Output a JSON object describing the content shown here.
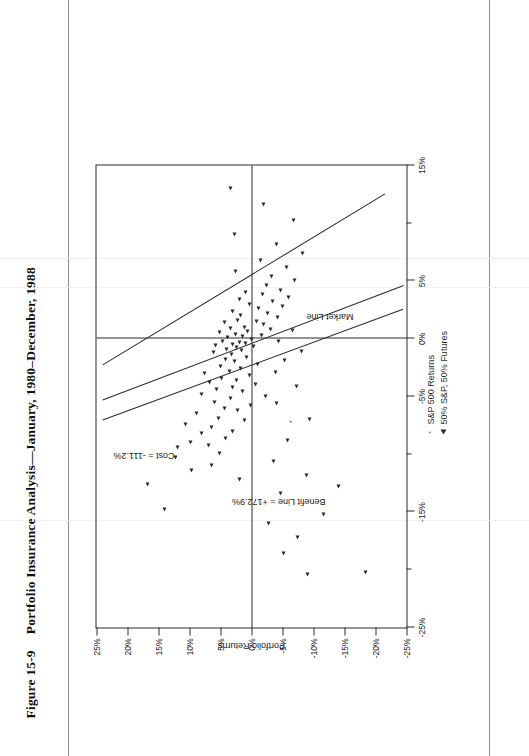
{
  "caption": {
    "figure_number": "Figure 15-9",
    "title": "Portfolio Insurance Analysis—January, 1980–December, 1988"
  },
  "chart_data": {
    "type": "scatter",
    "title": "Portfolio Insurance Analysis—January, 1980–December, 1988",
    "xlabel": "",
    "ylabel": "Portfolio Returns",
    "xlim": [
      -25,
      15
    ],
    "ylim": [
      -25,
      25
    ],
    "grid": false,
    "x_ticks": [
      -25,
      -20,
      -15,
      -10,
      -5,
      0,
      5,
      10,
      15
    ],
    "x_tick_labels": [
      "-25%",
      "",
      "-15%",
      "",
      "-5%",
      "0%",
      "5%",
      "",
      "15%"
    ],
    "y_ticks": [
      25,
      20,
      15,
      10,
      5,
      0,
      -5,
      -10,
      -15,
      -20,
      -25
    ],
    "y_tick_labels": [
      "25%",
      "20%",
      "15%",
      "10%",
      "5%",
      "0%",
      "-5%",
      "-10%",
      "-15%",
      "-20%",
      "-25%"
    ],
    "legend_position": "below-right",
    "series": [
      {
        "name": "S&P 500 Returns",
        "marker": "dot",
        "points": [
          [
            -7.2,
            -6.3
          ]
        ]
      },
      {
        "name": "50% S&P, 50% Futures",
        "marker": "triangle",
        "points": [
          [
            -20.4,
            -9.1
          ],
          [
            -14.8,
            14.0
          ],
          [
            -12.6,
            16.8
          ],
          [
            -12.2,
            2.0
          ],
          [
            -11.4,
            9.6
          ],
          [
            -11.0,
            6.4
          ],
          [
            -10.3,
            12.2
          ],
          [
            -9.9,
            5.2
          ],
          [
            -9.4,
            12.0
          ],
          [
            -9.2,
            7.0
          ],
          [
            -9.0,
            9.8
          ],
          [
            -8.6,
            4.2
          ],
          [
            -8.2,
            8.1
          ],
          [
            -8.0,
            3.0
          ],
          [
            -7.7,
            6.4
          ],
          [
            -7.4,
            10.6
          ],
          [
            -7.1,
            1.2
          ],
          [
            -6.9,
            5.4
          ],
          [
            -6.5,
            8.8
          ],
          [
            -6.2,
            2.2
          ],
          [
            -6.0,
            4.4
          ],
          [
            -5.8,
            0.2
          ],
          [
            -5.5,
            6.0
          ],
          [
            -5.2,
            3.4
          ],
          [
            -5.0,
            -2.2
          ],
          [
            -4.8,
            8.0
          ],
          [
            -4.6,
            1.4
          ],
          [
            -4.4,
            5.6
          ],
          [
            -4.2,
            3.0
          ],
          [
            -4.0,
            -0.6
          ],
          [
            -3.8,
            6.8
          ],
          [
            -3.6,
            2.4
          ],
          [
            -3.4,
            4.8
          ],
          [
            -3.2,
            0.4
          ],
          [
            -3.0,
            7.6
          ],
          [
            -2.8,
            3.6
          ],
          [
            -2.6,
            1.8
          ],
          [
            -2.4,
            5.0
          ],
          [
            -2.2,
            -1.0
          ],
          [
            -2.0,
            2.8
          ],
          [
            -1.8,
            4.2
          ],
          [
            -1.6,
            0.8
          ],
          [
            -1.4,
            3.2
          ],
          [
            -1.2,
            6.2
          ],
          [
            -1.0,
            1.6
          ],
          [
            -0.9,
            4.0
          ],
          [
            -0.8,
            2.4
          ],
          [
            -0.7,
            -0.4
          ],
          [
            -0.6,
            5.8
          ],
          [
            -0.5,
            3.0
          ],
          [
            -0.4,
            1.0
          ],
          [
            -0.3,
            2.0
          ],
          [
            -0.2,
            4.6
          ],
          [
            -0.1,
            0.0
          ],
          [
            0.1,
            3.8
          ],
          [
            0.2,
            1.4
          ],
          [
            0.3,
            -1.6
          ],
          [
            0.4,
            2.6
          ],
          [
            0.5,
            5.2
          ],
          [
            0.6,
            0.6
          ],
          [
            0.8,
            -3.0
          ],
          [
            0.9,
            3.4
          ],
          [
            1.0,
            1.2
          ],
          [
            1.2,
            -2.0
          ],
          [
            1.4,
            4.4
          ],
          [
            1.5,
            -0.8
          ],
          [
            1.6,
            2.2
          ],
          [
            1.8,
            -4.2
          ],
          [
            2.0,
            1.8
          ],
          [
            2.2,
            -2.6
          ],
          [
            2.4,
            3.0
          ],
          [
            2.6,
            -1.2
          ],
          [
            2.8,
            -5.0
          ],
          [
            3.0,
            0.4
          ],
          [
            3.2,
            -3.4
          ],
          [
            3.4,
            2.0
          ],
          [
            3.6,
            -6.0
          ],
          [
            3.8,
            -1.8
          ],
          [
            4.0,
            1.0
          ],
          [
            4.2,
            -4.6
          ],
          [
            4.6,
            -2.4
          ],
          [
            5.0,
            -7.0
          ],
          [
            5.4,
            -3.2
          ],
          [
            5.8,
            2.6
          ],
          [
            6.2,
            -5.6
          ],
          [
            6.8,
            -1.4
          ],
          [
            7.4,
            -8.2
          ],
          [
            8.2,
            -4.0
          ],
          [
            9.0,
            2.8
          ],
          [
            10.2,
            -6.8
          ],
          [
            11.6,
            -2.0
          ],
          [
            13.0,
            3.4
          ],
          [
            -18.6,
            -5.2
          ],
          [
            -17.2,
            -7.4
          ],
          [
            -16.0,
            -2.8
          ],
          [
            -15.2,
            -11.6
          ],
          [
            -13.4,
            -4.6
          ],
          [
            -11.8,
            -8.8
          ],
          [
            -10.6,
            -3.6
          ],
          [
            -8.8,
            -5.8
          ],
          [
            -7.0,
            -9.4
          ],
          [
            -5.6,
            -4.0
          ],
          [
            -4.1,
            -7.2
          ],
          [
            -2.9,
            -3.8
          ],
          [
            -1.9,
            -5.4
          ],
          [
            -1.1,
            -8.0
          ],
          [
            -0.2,
            -4.4
          ],
          [
            0.7,
            -6.6
          ],
          [
            -12.8,
            -14.0
          ],
          [
            -20.2,
            -18.4
          ]
        ]
      }
    ],
    "fit_lines": [
      {
        "name": "Market Line",
        "label": "Market Line"
      },
      {
        "name": "Benefit Line",
        "label": "Benefit Line = +172.9%"
      },
      {
        "name": "Cost Line",
        "label": "Cost = -111.2%"
      }
    ],
    "annotations": [
      {
        "text": "Cost = -111.2%",
        "x": -10.5,
        "y": 12.5
      },
      {
        "text": "Benefit Line = +172.9%",
        "x": -14.5,
        "y": -12.0
      },
      {
        "text": "Market Line",
        "x": 1.5,
        "y": -16.5
      }
    ]
  },
  "legend": {
    "items": [
      {
        "label": "S&P 500 Returns",
        "marker": "dot"
      },
      {
        "label": "50% S&P, 50% Futures",
        "marker": "triangle"
      }
    ]
  },
  "axis": {
    "y_title": "Portfolio Returns"
  }
}
